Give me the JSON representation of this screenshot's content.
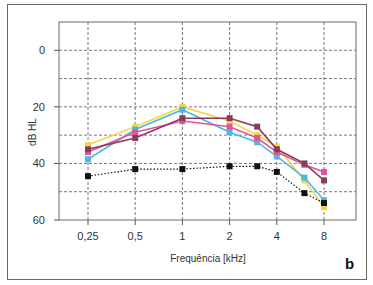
{
  "chart_data": {
    "type": "line",
    "title": "",
    "panel_label": "b",
    "xlabel": "Frequência [kHz]",
    "ylabel": "dB HL",
    "x_scale": "log2",
    "x_tick_labels": [
      "0,25",
      "0,5",
      "1",
      "2",
      "4",
      "8"
    ],
    "x_tick_values": [
      0.25,
      0.5,
      1,
      2,
      4,
      8
    ],
    "y_tick_labels": [
      "0",
      "20",
      "40",
      "60"
    ],
    "y_tick_values": [
      0,
      20,
      40,
      60
    ],
    "ylim": [
      -10,
      60
    ],
    "y_inverted": true,
    "grid": {
      "on": true,
      "style": "dashed",
      "y_step": 10
    },
    "legend": null,
    "x": [
      0.25,
      0.5,
      1,
      2,
      3,
      4,
      6,
      8
    ],
    "series": [
      {
        "name": "yellow",
        "color": "#f5d547",
        "line_style": "solid",
        "marker": "square",
        "values": [
          33.5,
          27,
          20,
          25,
          30,
          34,
          46,
          55.5
        ]
      },
      {
        "name": "cyan",
        "color": "#4fb8e0",
        "line_style": "solid",
        "marker": "square",
        "values": [
          38.5,
          28,
          21,
          29,
          32.5,
          37.5,
          45,
          53
        ]
      },
      {
        "name": "pink",
        "color": "#e0559a",
        "line_style": "solid",
        "marker": "square",
        "values": [
          36,
          29,
          25,
          27,
          31,
          36,
          40.5,
          43
        ]
      },
      {
        "name": "purple",
        "color": "#8b3a62",
        "line_style": "solid",
        "marker": "square",
        "values": [
          35,
          31,
          24,
          24,
          27,
          35,
          40,
          46
        ]
      },
      {
        "name": "black",
        "color": "#111111",
        "line_style": "dotted",
        "marker": "square",
        "values": [
          44.5,
          42,
          42,
          41,
          41,
          43,
          50.5,
          54
        ]
      }
    ]
  }
}
